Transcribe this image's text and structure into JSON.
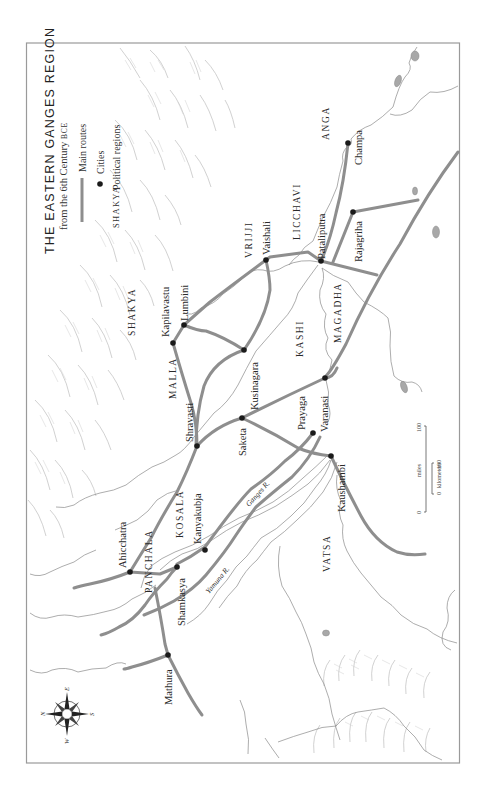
{
  "map": {
    "title": "THE EASTERN GANGES REGION",
    "subtitle_main": "from the 6th Century ",
    "subtitle_era": "BCE",
    "legend": {
      "routes_label": "Main routes",
      "cities_label": "Cities",
      "region_example": "SHAKYA",
      "regions_label": "Political regions"
    },
    "colors": {
      "route": "#8e8e8e",
      "city": "#1a1a1a",
      "frame": "#9a9a9a",
      "river": "#8a8a8a",
      "mountain": "#bdbdbd"
    },
    "cities": [
      {
        "name": "Champa",
        "x": 348,
        "y": 143
      },
      {
        "name": "Rajagriha",
        "x": 353,
        "y": 212
      },
      {
        "name": "Pataliputra",
        "x": 321,
        "y": 261
      },
      {
        "name": "Vaishali",
        "x": 266,
        "y": 260
      },
      {
        "name": "Lumbini",
        "x": 184,
        "y": 325
      },
      {
        "name": "Kapilavastu",
        "x": 173,
        "y": 343
      },
      {
        "name": "Kusinagara",
        "x": 244,
        "y": 350
      },
      {
        "name": "Varanasi",
        "x": 325,
        "y": 378
      },
      {
        "name": "Saketa",
        "x": 242,
        "y": 418
      },
      {
        "name": "Prayaga",
        "x": 313,
        "y": 433
      },
      {
        "name": "Shravasti",
        "x": 197,
        "y": 446
      },
      {
        "name": "Kaushambi",
        "x": 331,
        "y": 456
      },
      {
        "name": "Kanyakubja",
        "x": 205,
        "y": 550
      },
      {
        "name": "Shamkasya",
        "x": 177,
        "y": 567
      },
      {
        "name": "Ahicchatra",
        "x": 130,
        "y": 572
      },
      {
        "name": "Mathura",
        "x": 168,
        "y": 655
      }
    ],
    "regions": [
      "ANGA",
      "LICCHAVI",
      "VRIJJI",
      "SHAKYA",
      "MALLA",
      "KASHI",
      "MAGADHA",
      "KOSALA",
      "PANCHALA",
      "VATSA"
    ],
    "rivers": {
      "ganges": "Ganges R.",
      "yamuna": "Yamuna R."
    },
    "scale": {
      "miles_label": "miles",
      "miles_start": "0",
      "miles_end": "100",
      "km_label": "kilometers",
      "km_start": "0",
      "km_end": "100"
    },
    "compass": {
      "n": "N",
      "e": "E",
      "s": "S",
      "w": "W"
    }
  }
}
